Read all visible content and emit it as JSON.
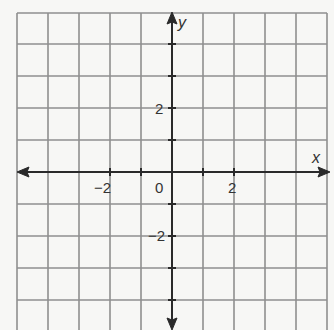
{
  "diagram": {
    "type": "coordinate-plane",
    "x_axis_label": "x",
    "y_axis_label": "y",
    "x_range": [
      -5,
      5
    ],
    "y_range": [
      -5,
      5
    ],
    "grid_step": 1,
    "tick_labels": {
      "x_neg": "−2",
      "x_pos": "2",
      "origin": "0",
      "y_pos": "2",
      "y_neg": "−2"
    },
    "colors": {
      "grid": "#8f8f8f",
      "axis": "#2a2a2a",
      "background": "#f7f7f5"
    }
  }
}
